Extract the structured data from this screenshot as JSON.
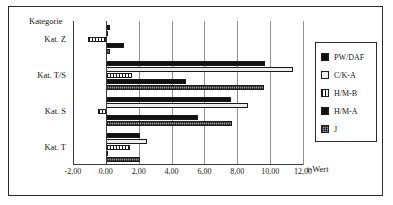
{
  "chart_data": {
    "type": "bar",
    "orientation": "horizontal",
    "title": "",
    "xlabel": "t-Wert",
    "ylabel": "Kategorie",
    "categories": [
      "Kat. Z",
      "Kat. T/S",
      "Kat. S",
      "Kat. T"
    ],
    "category_order_top_to_bottom": [
      "Kat. Z",
      "Kat. T/S",
      "Kat. S",
      "Kat. T"
    ],
    "series": [
      {
        "name": "PW/DAF",
        "values": [
          0.25,
          9.7,
          7.6,
          2.1
        ]
      },
      {
        "name": "C/K-A",
        "values": [
          0.1,
          11.4,
          8.65,
          2.5
        ]
      },
      {
        "name": "H/M-B",
        "values": [
          -1.1,
          1.6,
          -0.5,
          1.5
        ]
      },
      {
        "name": "H/M-A",
        "values": [
          1.1,
          4.9,
          5.6,
          0.15
        ]
      },
      {
        "name": "J",
        "values": [
          0.25,
          9.65,
          7.7,
          2.1
        ]
      }
    ],
    "xlim": [
      -2.0,
      12.0
    ],
    "xticks": [
      -2.0,
      0.0,
      2.0,
      4.0,
      6.0,
      8.0,
      10.0,
      12.0
    ],
    "xtick_labels": [
      "-2,00",
      "0,00",
      "2,00",
      "4,00",
      "6,00",
      "8,00",
      "10,00",
      "12,00"
    ],
    "grid": "vertical",
    "legend_position": "right"
  },
  "legend": {
    "entries": [
      {
        "label": "PW/DAF",
        "pattern": "solid-black",
        "color": "#111111"
      },
      {
        "label": "C/K-A",
        "pattern": "solid-white",
        "color": "#eeeeee"
      },
      {
        "label": "H/M-B",
        "pattern": "vertical-stripes",
        "color": "#ffffff"
      },
      {
        "label": "H/M-A",
        "pattern": "solid-black",
        "color": "#111111"
      },
      {
        "label": "J",
        "pattern": "dotted-gray",
        "color": "#9a9a9a"
      }
    ]
  },
  "axes": {
    "category_axis_title": "Kategorie",
    "value_axis_title": "t-Wert"
  }
}
